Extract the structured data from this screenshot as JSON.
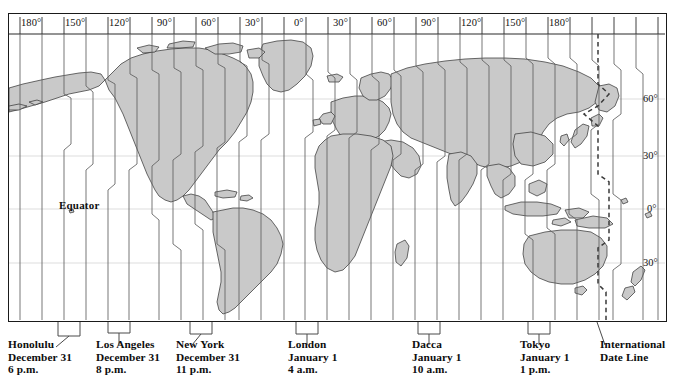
{
  "map": {
    "title_visible": false,
    "colors": {
      "land_fill": "#c9c9c9",
      "land_stroke": "#3a3a3a",
      "zone_line": "#5a5a5a",
      "grid_line": "#b9b9b9",
      "border": "#1a1a1a",
      "date_line": "#4a4a4a",
      "background": "#ffffff",
      "text": "#111111"
    },
    "longitude_labels": [
      {
        "text": "180°",
        "x": 22
      },
      {
        "text": "150°",
        "x": 88
      },
      {
        "text": "120°",
        "x": 154
      },
      {
        "text": "90°",
        "x": 223
      },
      {
        "text": "60°",
        "x": 289
      },
      {
        "text": "30°",
        "x": 355
      },
      {
        "text": "0°",
        "x": 424
      },
      {
        "text": "30°",
        "x": 487
      },
      {
        "text": "60°",
        "x": 553
      },
      {
        "text": "90°",
        "x": 619
      },
      {
        "text": "120°",
        "x": 682
      },
      {
        "text": "150°",
        "x": 748
      },
      {
        "text": "180°",
        "x": 814
      }
    ],
    "latitude_labels": [
      {
        "text": "60°",
        "y": 98
      },
      {
        "text": "30°",
        "y": 155
      },
      {
        "text": "0°",
        "y": 208
      },
      {
        "text": "30°",
        "y": 262
      }
    ],
    "equator_label": "Equator",
    "date_line_label": "International Date Line"
  },
  "callouts": [
    {
      "id": "honolulu",
      "city": "Honolulu",
      "date": "December 31",
      "time": "6 p.m.",
      "label_x": 8,
      "bracket_left": 58,
      "bracket_right": 80
    },
    {
      "id": "los-angeles",
      "city": "Los Angeles",
      "date": "December 31",
      "time": "8 p.m.",
      "label_x": 96,
      "bracket_left": 108,
      "bracket_right": 130
    },
    {
      "id": "new-york",
      "city": "New York",
      "date": "December 31",
      "time": "11 p.m.",
      "label_x": 176,
      "bracket_left": 190,
      "bracket_right": 212
    },
    {
      "id": "london",
      "city": "London",
      "date": "January 1",
      "time": "4 a.m.",
      "label_x": 288,
      "bracket_left": 296,
      "bracket_right": 318
    },
    {
      "id": "dacca",
      "city": "Dacca",
      "date": "January 1",
      "time": "10 a.m.",
      "label_x": 412,
      "bracket_left": 418,
      "bracket_right": 440
    },
    {
      "id": "tokyo",
      "city": "Tokyo",
      "date": "January 1",
      "time": "1 p.m.",
      "label_x": 520,
      "bracket_left": 528,
      "bracket_right": 550
    }
  ],
  "date_line_callout": {
    "id": "international-date-line",
    "line1": "International",
    "line2": "Date Line",
    "label_x": 600,
    "pointer_x": 597
  }
}
